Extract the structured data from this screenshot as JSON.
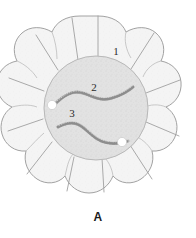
{
  "figure": {
    "caption": "A",
    "caption_name": "figure-label-A"
  },
  "labels": [
    {
      "id": "label-1",
      "text": "1",
      "x": 116,
      "y": 55,
      "target": "outer-cell-layer"
    },
    {
      "id": "label-2",
      "text": "2",
      "x": 94,
      "y": 91,
      "target": "coiled-filament"
    },
    {
      "id": "label-3",
      "text": "3",
      "x": 72,
      "y": 117,
      "target": "white-vesicle"
    }
  ],
  "colors": {
    "outer_cell_fill": "#f3f3f3",
    "outer_cell_stroke": "#9b9b9b",
    "inner_body_fill": "#e0e0e0",
    "inner_body_stroke": "#b5b5b5",
    "filament_stroke": "#9a9a9a",
    "vesicle_fill": "#ffffff",
    "vesicle_stroke": "#c8c8c8",
    "label_text": "#2b2b2b",
    "caption_text": "#1a1a1a",
    "background": "#ffffff"
  },
  "geometry": {
    "center_x": 98,
    "center_y": 110,
    "outer_lobe_count": 12,
    "inner_radius": 50,
    "outer_radius": 90
  },
  "structures": {
    "outer_ring_name": "outer-cell-ring",
    "inner_body_name": "inner-cytoplasm",
    "filaments": [
      {
        "name": "coiled-filament-upper",
        "shape": "sigmoid-coil"
      },
      {
        "name": "coiled-filament-lower",
        "shape": "sigmoid-coil"
      }
    ],
    "vesicles": [
      {
        "name": "white-vesicle-left",
        "cx": 52,
        "cy": 105,
        "r": 4.6
      },
      {
        "name": "white-vesicle-right",
        "cx": 122,
        "cy": 142,
        "r": 4.6
      }
    ]
  }
}
